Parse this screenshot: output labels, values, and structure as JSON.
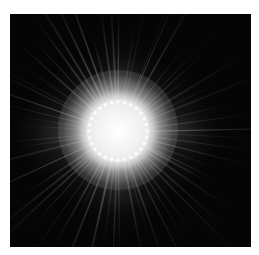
{
  "image": {
    "subject": "bright sun / starburst with radiating corona rays",
    "background_color": "#ffffff",
    "frame_color": "#050505",
    "core_color": "#ffffff",
    "glow_color": "#bdbdbd",
    "ray_color": "#9a9a9a",
    "bead_count": 28
  }
}
